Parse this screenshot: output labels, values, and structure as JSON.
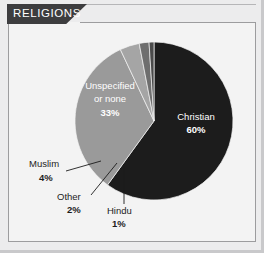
{
  "card": {
    "title": "RELIGIONS",
    "background_color": "#ececed",
    "panel_color": "#f3f3f3",
    "header_color": "#3d3d3f",
    "border_color": "#9c9c9e"
  },
  "chart_data": {
    "type": "pie",
    "title": "RELIGIONS",
    "xlabel": "",
    "ylabel": "",
    "legend_position": "none",
    "grid": false,
    "start_angle_deg": 0,
    "direction": "clockwise",
    "center": {
      "x": 154,
      "y": 121
    },
    "radius": 79,
    "categories": [
      "Christian",
      "Unspecified or none",
      "Muslim",
      "Other",
      "Hindu"
    ],
    "values": [
      60,
      33,
      4,
      2,
      1
    ],
    "unit": "%",
    "slices": [
      {
        "name": "Christian",
        "label": "Christian",
        "value": 60,
        "value_label": "60%",
        "color": "#1c1c1c",
        "label_placement": "inside",
        "label_color": "#ffffff",
        "label_x": 196,
        "label_y": 120,
        "pct_x": 196,
        "pct_y": 132
      },
      {
        "name": "Unspecified or none",
        "label_line_1": "Unspecified",
        "label_line_2": "or none",
        "value": 33,
        "value_label": "33%",
        "color": "#9a9a9a",
        "label_placement": "inside",
        "label_color": "#ffffff",
        "label_x": 110,
        "label_y": 89,
        "pct_x": 110,
        "pct_y": 115
      },
      {
        "name": "Muslim",
        "label": "Muslim",
        "value": 4,
        "value_label": "4%",
        "color": "#a5a5a5",
        "label_placement": "outside",
        "label_color": "#1c1c1c",
        "label_x": 30,
        "label_y": 167,
        "pct_x": 40,
        "pct_y": 180
      },
      {
        "name": "Other",
        "label": "Other",
        "value": 2,
        "value_label": "2%",
        "color": "#6e6e6e",
        "label_placement": "outside",
        "label_color": "#1c1c1c",
        "label_x": 58,
        "label_y": 199,
        "pct_x": 68,
        "pct_y": 212
      },
      {
        "name": "Hindu",
        "label": "Hindu",
        "value": 1,
        "value_label": "1%",
        "color": "#4a4a4a",
        "label_placement": "outside",
        "label_color": "#1c1c1c",
        "label_x": 103,
        "label_y": 213,
        "pct_x": 113,
        "pct_y": 226
      }
    ]
  }
}
